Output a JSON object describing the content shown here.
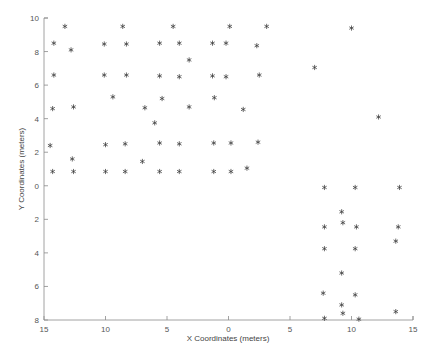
{
  "figure": {
    "background_color": "#ffffff",
    "axis_color": "#8a8a8a",
    "marker_color": "#3b3b3b",
    "marker_symbol": "asterisk"
  },
  "chart_data": {
    "type": "scatter",
    "title": "",
    "xlabel": "X Coordinates (meters)",
    "ylabel": "Y Coordinates (meters)",
    "grid": false,
    "legend": null,
    "xlim": [
      -15,
      15
    ],
    "ylim": [
      -8,
      10
    ],
    "x_tick_values": [
      -15,
      -10,
      -5,
      0,
      5,
      10,
      15
    ],
    "x_tick_labels": [
      "15",
      "10",
      "5",
      "0",
      "5",
      "10",
      "15"
    ],
    "y_tick_values": [
      10,
      8,
      6,
      4,
      2,
      0,
      -2,
      -4,
      -6,
      -8
    ],
    "y_tick_labels": [
      "10",
      "8",
      "6",
      "4",
      "2",
      "0",
      "2",
      "4",
      "6",
      "8"
    ],
    "series": [
      {
        "name": "coordinates",
        "marker": "*",
        "color": "#3b3b3b",
        "points": [
          [
            -13.3,
            9.5
          ],
          [
            -8.6,
            9.5
          ],
          [
            -4.5,
            9.5
          ],
          [
            0.1,
            9.5
          ],
          [
            3.1,
            9.5
          ],
          [
            10.0,
            9.4
          ],
          [
            -14.2,
            8.5
          ],
          [
            -12.8,
            8.1
          ],
          [
            -10.1,
            8.45
          ],
          [
            -8.3,
            8.45
          ],
          [
            -5.6,
            8.5
          ],
          [
            -4.0,
            8.5
          ],
          [
            -1.3,
            8.5
          ],
          [
            -0.2,
            8.5
          ],
          [
            2.3,
            8.35
          ],
          [
            -3.2,
            7.5
          ],
          [
            7.0,
            7.05
          ],
          [
            -14.2,
            6.6
          ],
          [
            -10.1,
            6.6
          ],
          [
            -8.3,
            6.6
          ],
          [
            -5.6,
            6.55
          ],
          [
            -4.0,
            6.5
          ],
          [
            -1.3,
            6.55
          ],
          [
            -0.2,
            6.5
          ],
          [
            2.5,
            6.6
          ],
          [
            -9.4,
            5.3
          ],
          [
            -5.4,
            5.2
          ],
          [
            -1.15,
            5.25
          ],
          [
            -14.3,
            4.6
          ],
          [
            -12.6,
            4.7
          ],
          [
            -6.8,
            4.65
          ],
          [
            -3.2,
            4.7
          ],
          [
            1.2,
            4.55
          ],
          [
            12.2,
            4.1
          ],
          [
            -6.0,
            3.75
          ],
          [
            -14.5,
            2.4
          ],
          [
            -10.0,
            2.45
          ],
          [
            -8.4,
            2.5
          ],
          [
            -5.6,
            2.55
          ],
          [
            -4.0,
            2.5
          ],
          [
            -1.2,
            2.55
          ],
          [
            0.2,
            2.55
          ],
          [
            2.4,
            2.6
          ],
          [
            -12.7,
            1.6
          ],
          [
            -7.0,
            1.45
          ],
          [
            1.5,
            1.05
          ],
          [
            -14.3,
            0.85
          ],
          [
            -12.6,
            0.85
          ],
          [
            -10.0,
            0.85
          ],
          [
            -8.4,
            0.85
          ],
          [
            -5.6,
            0.85
          ],
          [
            -4.0,
            0.85
          ],
          [
            -1.2,
            0.85
          ],
          [
            0.2,
            0.85
          ],
          [
            7.8,
            -0.1
          ],
          [
            10.3,
            -0.1
          ],
          [
            13.9,
            -0.1
          ],
          [
            9.2,
            -1.55
          ],
          [
            7.8,
            -2.45
          ],
          [
            9.3,
            -2.2
          ],
          [
            10.4,
            -2.45
          ],
          [
            13.8,
            -2.45
          ],
          [
            7.8,
            -3.75
          ],
          [
            10.3,
            -3.75
          ],
          [
            13.6,
            -3.3
          ],
          [
            9.2,
            -5.2
          ],
          [
            7.7,
            -6.4
          ],
          [
            10.3,
            -6.5
          ],
          [
            9.2,
            -7.1
          ],
          [
            9.3,
            -7.6
          ],
          [
            7.8,
            -7.9
          ],
          [
            10.6,
            -7.95
          ],
          [
            13.6,
            -7.5
          ]
        ]
      }
    ]
  }
}
